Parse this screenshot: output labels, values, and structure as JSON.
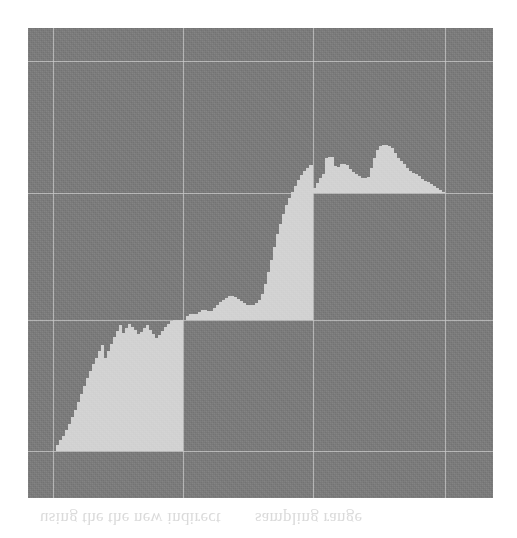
{
  "figure": {
    "title": "",
    "panel": {
      "background_color": "#7b7b7b",
      "fill_color": "#d2d2d2",
      "gridline_color": "#c9c9c9",
      "page_background": "#ffffff"
    }
  },
  "ghost_text": {
    "line_left": "using the the new indirect",
    "line_right": "sampling range"
  },
  "chart_data": {
    "type": "area",
    "title": "",
    "xlabel": "",
    "ylabel": "",
    "xlim": [
      0,
      465
    ],
    "ylim": [
      0,
      470
    ],
    "grid": true,
    "legend_position": "none",
    "gridlines": {
      "vertical": [
        25,
        155,
        285,
        417
      ],
      "horizontal": [
        33,
        165,
        292,
        423
      ]
    },
    "baseline_levels": [
      423,
      292,
      165
    ],
    "series": [
      {
        "name": "segment-1",
        "baseline": 423,
        "x_start": 25,
        "x_end": 155,
        "steps": [
          {
            "x": 25,
            "top": 423
          },
          {
            "x": 28,
            "top": 417
          },
          {
            "x": 31,
            "top": 412
          },
          {
            "x": 34,
            "top": 408
          },
          {
            "x": 37,
            "top": 402
          },
          {
            "x": 40,
            "top": 396
          },
          {
            "x": 43,
            "top": 389
          },
          {
            "x": 46,
            "top": 382
          },
          {
            "x": 49,
            "top": 374
          },
          {
            "x": 52,
            "top": 366
          },
          {
            "x": 55,
            "top": 358
          },
          {
            "x": 58,
            "top": 350
          },
          {
            "x": 61,
            "top": 343
          },
          {
            "x": 64,
            "top": 336
          },
          {
            "x": 67,
            "top": 330
          },
          {
            "x": 70,
            "top": 323
          },
          {
            "x": 73,
            "top": 317
          },
          {
            "x": 76,
            "top": 330
          },
          {
            "x": 79,
            "top": 323
          },
          {
            "x": 82,
            "top": 316
          },
          {
            "x": 85,
            "top": 309
          },
          {
            "x": 88,
            "top": 303
          },
          {
            "x": 91,
            "top": 297
          },
          {
            "x": 94,
            "top": 305
          },
          {
            "x": 97,
            "top": 300
          },
          {
            "x": 100,
            "top": 296
          },
          {
            "x": 103,
            "top": 299
          },
          {
            "x": 106,
            "top": 302
          },
          {
            "x": 109,
            "top": 306
          },
          {
            "x": 112,
            "top": 304
          },
          {
            "x": 115,
            "top": 300
          },
          {
            "x": 118,
            "top": 297
          },
          {
            "x": 121,
            "top": 302
          },
          {
            "x": 124,
            "top": 306
          },
          {
            "x": 127,
            "top": 310
          },
          {
            "x": 130,
            "top": 307
          },
          {
            "x": 133,
            "top": 303
          },
          {
            "x": 136,
            "top": 299
          },
          {
            "x": 139,
            "top": 296
          },
          {
            "x": 142,
            "top": 293
          },
          {
            "x": 145,
            "top": 292
          },
          {
            "x": 148,
            "top": 292
          },
          {
            "x": 151,
            "top": 292
          },
          {
            "x": 155,
            "top": 292
          }
        ]
      },
      {
        "name": "segment-2",
        "baseline": 292,
        "x_start": 155,
        "x_end": 285,
        "steps": [
          {
            "x": 155,
            "top": 292
          },
          {
            "x": 158,
            "top": 288
          },
          {
            "x": 161,
            "top": 286
          },
          {
            "x": 164,
            "top": 286
          },
          {
            "x": 167,
            "top": 286
          },
          {
            "x": 170,
            "top": 284
          },
          {
            "x": 173,
            "top": 282
          },
          {
            "x": 176,
            "top": 282
          },
          {
            "x": 179,
            "top": 283
          },
          {
            "x": 182,
            "top": 283
          },
          {
            "x": 185,
            "top": 280
          },
          {
            "x": 188,
            "top": 277
          },
          {
            "x": 191,
            "top": 274
          },
          {
            "x": 194,
            "top": 272
          },
          {
            "x": 197,
            "top": 270
          },
          {
            "x": 200,
            "top": 268
          },
          {
            "x": 203,
            "top": 268
          },
          {
            "x": 206,
            "top": 269
          },
          {
            "x": 209,
            "top": 271
          },
          {
            "x": 212,
            "top": 273
          },
          {
            "x": 215,
            "top": 275
          },
          {
            "x": 218,
            "top": 277
          },
          {
            "x": 221,
            "top": 277
          },
          {
            "x": 224,
            "top": 277
          },
          {
            "x": 227,
            "top": 275
          },
          {
            "x": 230,
            "top": 272
          },
          {
            "x": 233,
            "top": 266
          },
          {
            "x": 236,
            "top": 256
          },
          {
            "x": 239,
            "top": 244
          },
          {
            "x": 242,
            "top": 232
          },
          {
            "x": 245,
            "top": 219
          },
          {
            "x": 248,
            "top": 206
          },
          {
            "x": 251,
            "top": 196
          },
          {
            "x": 254,
            "top": 186
          },
          {
            "x": 257,
            "top": 177
          },
          {
            "x": 260,
            "top": 170
          },
          {
            "x": 263,
            "top": 164
          },
          {
            "x": 266,
            "top": 158
          },
          {
            "x": 269,
            "top": 152
          },
          {
            "x": 272,
            "top": 147
          },
          {
            "x": 275,
            "top": 143
          },
          {
            "x": 278,
            "top": 140
          },
          {
            "x": 281,
            "top": 137
          },
          {
            "x": 285,
            "top": 165
          }
        ]
      },
      {
        "name": "segment-3",
        "baseline": 165,
        "x_start": 285,
        "x_end": 417,
        "steps": [
          {
            "x": 285,
            "top": 160
          },
          {
            "x": 288,
            "top": 155
          },
          {
            "x": 291,
            "top": 150
          },
          {
            "x": 294,
            "top": 146
          },
          {
            "x": 297,
            "top": 130
          },
          {
            "x": 300,
            "top": 129
          },
          {
            "x": 303,
            "top": 129
          },
          {
            "x": 306,
            "top": 138
          },
          {
            "x": 309,
            "top": 139
          },
          {
            "x": 312,
            "top": 136
          },
          {
            "x": 315,
            "top": 136
          },
          {
            "x": 318,
            "top": 137
          },
          {
            "x": 321,
            "top": 141
          },
          {
            "x": 324,
            "top": 144
          },
          {
            "x": 327,
            "top": 146
          },
          {
            "x": 330,
            "top": 148
          },
          {
            "x": 333,
            "top": 150
          },
          {
            "x": 336,
            "top": 150
          },
          {
            "x": 339,
            "top": 149
          },
          {
            "x": 342,
            "top": 140
          },
          {
            "x": 345,
            "top": 130
          },
          {
            "x": 348,
            "top": 122
          },
          {
            "x": 351,
            "top": 118
          },
          {
            "x": 354,
            "top": 117
          },
          {
            "x": 357,
            "top": 117
          },
          {
            "x": 360,
            "top": 118
          },
          {
            "x": 363,
            "top": 120
          },
          {
            "x": 366,
            "top": 125
          },
          {
            "x": 369,
            "top": 130
          },
          {
            "x": 372,
            "top": 133
          },
          {
            "x": 375,
            "top": 136
          },
          {
            "x": 378,
            "top": 140
          },
          {
            "x": 381,
            "top": 143
          },
          {
            "x": 384,
            "top": 145
          },
          {
            "x": 387,
            "top": 146
          },
          {
            "x": 390,
            "top": 148
          },
          {
            "x": 393,
            "top": 151
          },
          {
            "x": 396,
            "top": 153
          },
          {
            "x": 399,
            "top": 154
          },
          {
            "x": 402,
            "top": 156
          },
          {
            "x": 405,
            "top": 158
          },
          {
            "x": 408,
            "top": 160
          },
          {
            "x": 411,
            "top": 162
          },
          {
            "x": 414,
            "top": 164
          },
          {
            "x": 417,
            "top": 165
          }
        ]
      }
    ]
  }
}
